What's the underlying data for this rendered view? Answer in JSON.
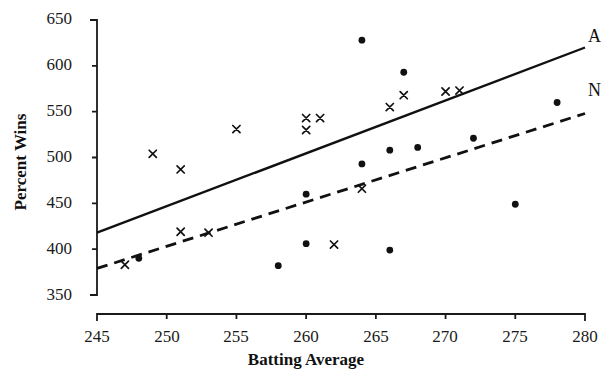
{
  "chart_data": {
    "type": "scatter",
    "title": "",
    "xlabel": "Batting Average",
    "ylabel": "Percent Wins",
    "xlim": [
      245,
      280
    ],
    "ylim": [
      350,
      650
    ],
    "xticks": [
      245,
      250,
      255,
      260,
      265,
      270,
      275,
      280
    ],
    "yticks": [
      350,
      400,
      450,
      500,
      550,
      600,
      650
    ],
    "grid": false,
    "legend_position": "right-end-of-lines",
    "series": [
      {
        "name": "A",
        "label": "A",
        "marker": "x",
        "line_style": "solid",
        "points": [
          {
            "x": 247,
            "y": 383
          },
          {
            "x": 249,
            "y": 504
          },
          {
            "x": 251,
            "y": 419
          },
          {
            "x": 251,
            "y": 487
          },
          {
            "x": 253,
            "y": 418
          },
          {
            "x": 255,
            "y": 531
          },
          {
            "x": 260,
            "y": 530
          },
          {
            "x": 260,
            "y": 543
          },
          {
            "x": 261,
            "y": 543
          },
          {
            "x": 262,
            "y": 405
          },
          {
            "x": 264,
            "y": 466
          },
          {
            "x": 266,
            "y": 555
          },
          {
            "x": 267,
            "y": 568
          },
          {
            "x": 270,
            "y": 572
          },
          {
            "x": 271,
            "y": 573
          }
        ],
        "fit_line": {
          "x1": 245,
          "y1": 418,
          "x2": 280,
          "y2": 620
        }
      },
      {
        "name": "N",
        "label": "N",
        "marker": "dot",
        "line_style": "dashed",
        "points": [
          {
            "x": 248,
            "y": 390
          },
          {
            "x": 258,
            "y": 382
          },
          {
            "x": 260,
            "y": 406
          },
          {
            "x": 260,
            "y": 460
          },
          {
            "x": 264,
            "y": 493
          },
          {
            "x": 264,
            "y": 628
          },
          {
            "x": 266,
            "y": 399
          },
          {
            "x": 266,
            "y": 508
          },
          {
            "x": 267,
            "y": 593
          },
          {
            "x": 268,
            "y": 511
          },
          {
            "x": 272,
            "y": 521
          },
          {
            "x": 275,
            "y": 449
          },
          {
            "x": 278,
            "y": 560
          }
        ],
        "fit_line": {
          "x1": 245,
          "y1": 379,
          "x2": 280,
          "y2": 548
        }
      }
    ]
  },
  "axis": {
    "x_tick_labels": [
      "245",
      "250",
      "255",
      "260",
      "265",
      "270",
      "275",
      "280"
    ],
    "y_tick_labels": [
      "650",
      "600",
      "550",
      "500",
      "450",
      "400",
      "350"
    ],
    "x_title": "Batting Average",
    "y_title": "Percent Wins"
  },
  "labels": {
    "series_a": "A",
    "series_n": "N"
  }
}
